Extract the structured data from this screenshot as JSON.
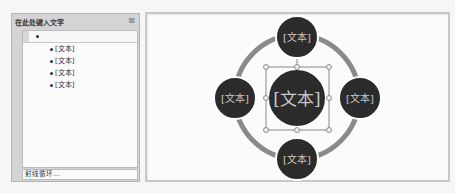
{
  "text_pane": {
    "title": "在此处键入文字",
    "close_icon": "close-icon",
    "close_glyph": "⊠",
    "items": [
      {
        "label": "",
        "level": 1
      },
      {
        "label": "[文本]",
        "level": 2
      },
      {
        "label": "[文本]",
        "level": 2
      },
      {
        "label": "[文本]",
        "level": 2
      },
      {
        "label": "[文本]",
        "level": 2
      }
    ],
    "footer_label": "射线循环..."
  },
  "diagram": {
    "layout": "radial-cycle",
    "center": {
      "label": "[文本]"
    },
    "satellites": [
      {
        "position": "top",
        "label": "[文本]"
      },
      {
        "position": "left",
        "label": "[文本]"
      },
      {
        "position": "right",
        "label": "[文本]"
      },
      {
        "position": "bottom",
        "label": "[文本]"
      }
    ],
    "colors": {
      "node_fill": "#2b2b2b",
      "node_text": "#c8c8c8",
      "ring": "#8a8a8a",
      "node_border": "#ffffff",
      "selection": "#6e6e6e"
    }
  }
}
